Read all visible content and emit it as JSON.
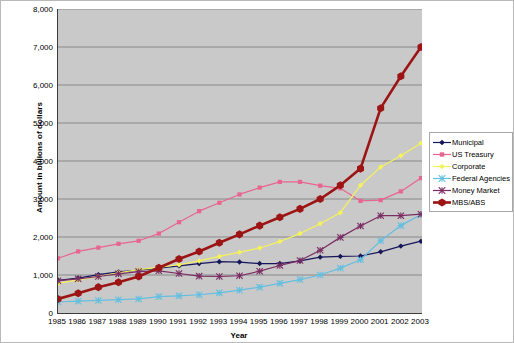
{
  "chart_data": {
    "type": "line",
    "title": "",
    "xlabel": "Year",
    "ylabel": "Amount in billions of dollars",
    "x": [
      1985,
      1986,
      1987,
      1988,
      1989,
      1990,
      1991,
      1992,
      1993,
      1994,
      1995,
      1996,
      1997,
      1998,
      1999,
      2000,
      2001,
      2002,
      2003
    ],
    "categories": [
      "1985",
      "1986",
      "1987",
      "1988",
      "1989",
      "1990",
      "1991",
      "1992",
      "1993",
      "1994",
      "1995",
      "1996",
      "1997",
      "1998",
      "1999",
      "2000",
      "2001",
      "2002",
      "2003"
    ],
    "xlim": [
      1985,
      2003
    ],
    "ylim": [
      0,
      8000
    ],
    "yticks": [
      0,
      1000,
      2000,
      3000,
      4000,
      5000,
      6000,
      7000,
      8000
    ],
    "ytick_labels": [
      "0",
      "1,000",
      "2,000",
      "3,000",
      "4,000",
      "5,000",
      "6,000",
      "7,000",
      "8,000"
    ],
    "grid": "horizontal",
    "legend_position": "right",
    "plot_background": "#c9c9c9",
    "series": [
      {
        "name": "Municipal",
        "color": "#16165a",
        "marker": "diamond",
        "values": [
          860,
          920,
          1010,
          1080,
          1130,
          1180,
          1240,
          1300,
          1350,
          1340,
          1300,
          1300,
          1370,
          1470,
          1490,
          1500,
          1610,
          1760,
          1890
        ]
      },
      {
        "name": "US Treasury",
        "color": "#e8658f",
        "marker": "square",
        "values": [
          1440,
          1620,
          1720,
          1820,
          1900,
          2090,
          2390,
          2680,
          2900,
          3120,
          3300,
          3450,
          3450,
          3350,
          3280,
          2950,
          2970,
          3200,
          3550
        ]
      },
      {
        "name": "Corporate",
        "color": "#f5f25a",
        "marker": "diamond",
        "values": [
          780,
          870,
          960,
          1060,
          1140,
          1200,
          1270,
          1370,
          1490,
          1600,
          1710,
          1880,
          2090,
          2350,
          2640,
          3360,
          3840,
          4140,
          4470
        ]
      },
      {
        "name": "Federal Agencies",
        "color": "#63bfe0",
        "marker": "star",
        "values": [
          290,
          310,
          330,
          350,
          370,
          430,
          450,
          480,
          530,
          600,
          680,
          780,
          880,
          1000,
          1180,
          1400,
          1900,
          2300,
          2590
        ]
      },
      {
        "name": "Money Market",
        "color": "#7b2d63",
        "marker": "star",
        "values": [
          850,
          900,
          960,
          1030,
          1090,
          1110,
          1040,
          970,
          960,
          980,
          1100,
          1250,
          1380,
          1650,
          1990,
          2290,
          2560,
          2560,
          2600
        ]
      },
      {
        "name": "MBS/ABS",
        "color": "#9c1414",
        "marker": "hexagon",
        "values": [
          370,
          520,
          680,
          810,
          960,
          1190,
          1420,
          1620,
          1850,
          2070,
          2300,
          2520,
          2740,
          3000,
          3360,
          3800,
          5390,
          6230,
          7000
        ]
      }
    ]
  }
}
